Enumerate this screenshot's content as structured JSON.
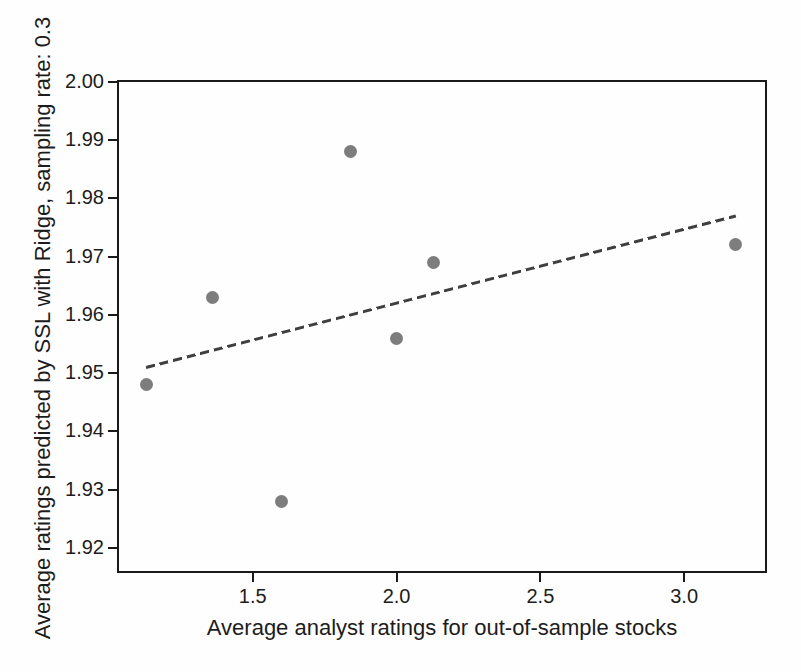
{
  "chart_data": {
    "type": "scatter",
    "title": "",
    "xlabel": "Average analyst ratings for out-of-sample stocks",
    "ylabel": "Average ratings predicted by SSL with Ridge, sampling rate: 0.3",
    "points": [
      {
        "x": 1.13,
        "y": 1.948
      },
      {
        "x": 1.36,
        "y": 1.963
      },
      {
        "x": 1.6,
        "y": 1.928
      },
      {
        "x": 1.84,
        "y": 1.988
      },
      {
        "x": 2.0,
        "y": 1.956
      },
      {
        "x": 2.13,
        "y": 1.969
      },
      {
        "x": 3.18,
        "y": 1.972
      }
    ],
    "trend_line": {
      "style": "dashed",
      "x1": 1.13,
      "y1": 1.951,
      "x2": 3.18,
      "y2": 1.977
    },
    "xticks": [
      "1.5",
      "2.0",
      "2.5",
      "3.0"
    ],
    "yticks": [
      "2.00",
      "1.99",
      "1.98",
      "1.97",
      "1.96",
      "1.95",
      "1.94",
      "1.93",
      "1.92"
    ],
    "xlim": [
      1.028,
      3.288
    ],
    "ylim": [
      1.9157,
      2.0003
    ],
    "grid": false,
    "legend": null,
    "point_color": "#7d7d7d",
    "trend_line_color": "#3f3f3f",
    "axis_color": "#1a1a1a",
    "text_color": "#1c1c1c"
  }
}
